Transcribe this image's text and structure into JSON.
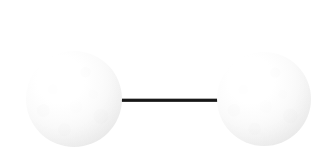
{
  "figure": {
    "background_color": "#ffffff",
    "canvas": {
      "width": 319,
      "height": 158
    }
  },
  "molecule": {
    "model_type": "ball-and-stick",
    "atom_count": 2,
    "bond_count": 1,
    "atoms": [
      {
        "id": "atom-left",
        "label": "",
        "center_x": 74,
        "center_y": 99,
        "radius": 48,
        "fill_color": "#f7f7f7",
        "edge_color": "#e4e4e4",
        "highlight_color": "#ffffff"
      },
      {
        "id": "atom-right",
        "label": "",
        "center_x": 264,
        "center_y": 99,
        "radius": 47,
        "fill_color": "#f7f7f7",
        "edge_color": "#e4e4e4",
        "highlight_color": "#ffffff"
      }
    ],
    "bond": {
      "id": "bond-1",
      "order": 1,
      "start_x": 121,
      "end_x": 221,
      "center_y": 100,
      "thickness": 4,
      "color": "#0e0e0e",
      "top_edge_color": "#8f8f8f"
    }
  }
}
